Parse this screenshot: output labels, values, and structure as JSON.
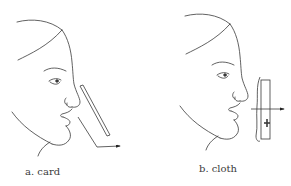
{
  "panels": [
    {
      "id": "a",
      "caption": "a. card",
      "object": "card",
      "description": "Profile face with a thin card held at an angle below the nose; arrow shows airflow deflected down and outward"
    },
    {
      "id": "b",
      "caption": "b. cloth",
      "object": "cloth",
      "description": "Profile face with a cloth held vertically in front of the mouth; arrow shows airflow passing through the cloth"
    }
  ],
  "colors": {
    "line": "#3a3a3a",
    "background": "#ffffff"
  }
}
